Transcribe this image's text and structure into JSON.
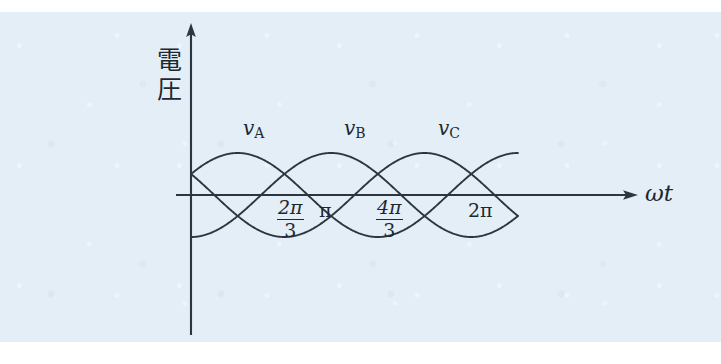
{
  "figure": {
    "title_visible": false,
    "background_color": "#e3eef7",
    "ink_color": "#2b3640"
  },
  "axes": {
    "y_axis_label": "電圧",
    "y_axis_label_chars": [
      "電",
      "圧"
    ],
    "x_axis_label": "ωt",
    "x_axis_label_parts": {
      "omega": "ω",
      "t": "t"
    },
    "origin_px": {
      "x": 191,
      "y": 195
    },
    "y_axis_top_px": 25,
    "y_axis_bottom_px": 335,
    "x_axis_end_px": 636
  },
  "ticks": [
    {
      "id": "tick-2pi-over-3",
      "type": "fraction",
      "numerator": "2π",
      "denominator": "3",
      "x_px": 292,
      "omega_t_value": "2π/3"
    },
    {
      "id": "tick-pi",
      "type": "plain",
      "text": "π",
      "x_px": 326,
      "omega_t_value": "π"
    },
    {
      "id": "tick-4pi-over-3",
      "type": "fraction",
      "numerator": "4π",
      "denominator": "3",
      "x_px": 391,
      "omega_t_value": "4π/3"
    },
    {
      "id": "tick-2pi",
      "type": "plain",
      "text": "2π",
      "x_px": 481,
      "omega_t_value": "2π"
    }
  ],
  "curve_labels": [
    {
      "id": "label-va",
      "base": "v",
      "sub": "A",
      "x_px": 252,
      "y_px": 118
    },
    {
      "id": "label-vb",
      "base": "v",
      "sub": "B",
      "x_px": 353,
      "y_px": 118
    },
    {
      "id": "label-vc",
      "base": "v",
      "sub": "C",
      "x_px": 447,
      "y_px": 118
    }
  ],
  "chart_data": {
    "type": "line",
    "title": "",
    "xlabel": "ωt",
    "ylabel": "電圧",
    "grid": false,
    "legend_position": "inline-above-curves",
    "x_unit": "radians",
    "x_range_rad": [
      0,
      7.33
    ],
    "y_range": [
      -1,
      1
    ],
    "amplitude_px": 42,
    "px_per_radian": 44.6,
    "series": [
      {
        "name": "vA",
        "label": "v_A",
        "phase_deg": 30,
        "phase_rad": 0.5236,
        "amplitude": 1,
        "formula": "sin(ωt + 30°)"
      },
      {
        "name": "vB",
        "label": "v_B",
        "phase_deg": -90,
        "phase_rad": -1.5708,
        "amplitude": 1,
        "formula": "sin(ωt - 90°)"
      },
      {
        "name": "vC",
        "label": "v_C",
        "phase_deg": 150,
        "phase_rad": 2.618,
        "amplitude": 1,
        "formula": "sin(ωt + 150°)"
      }
    ],
    "phase_separation_deg": 120,
    "tick_values_rad": [
      2.0944,
      3.1416,
      4.1888,
      6.2832
    ],
    "tick_labels": [
      "2π/3",
      "π",
      "4π/3",
      "2π"
    ]
  }
}
